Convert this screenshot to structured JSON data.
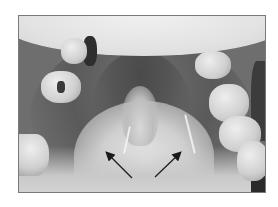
{
  "figure": {
    "type": "clinical-photograph",
    "color_mode": "grayscale",
    "frame": {
      "x": 18,
      "y": 15,
      "width": 246,
      "height": 176,
      "border_color": "#7a7a7a"
    },
    "annotations": [
      {
        "kind": "arrow",
        "name": "left-arrow",
        "from": [
          131,
          177
        ],
        "to": [
          104,
          150
        ],
        "color": "#1a1a1a"
      },
      {
        "kind": "arrow",
        "name": "right-arrow",
        "from": [
          154,
          176
        ],
        "to": [
          181,
          151
        ],
        "color": "#1a1a1a"
      }
    ],
    "palette": {
      "background": "#ffffff",
      "lip": "#e6e6e6",
      "palate": "#5c5c5c",
      "tongue": "#d8d8d8",
      "teeth": "#dcdcdc",
      "shadow": "#2e2e2e"
    }
  }
}
